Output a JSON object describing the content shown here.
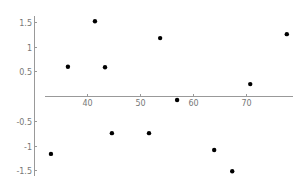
{
  "chart_data": {
    "type": "scatter",
    "title": "",
    "xlabel": "",
    "ylabel": "",
    "xlim": [
      31.5,
      79.5
    ],
    "ylim": [
      -1.6,
      1.6
    ],
    "grid": false,
    "legend": null,
    "x_ticks": [
      40,
      50,
      60,
      70
    ],
    "x_tick_labels": [
      "40",
      "50",
      "60",
      "70"
    ],
    "y_ticks": [
      1.5,
      1,
      0.5,
      -0.5,
      -1,
      -1.5
    ],
    "y_tick_labels": [
      "1.5",
      "1",
      "0.5",
      "-0.5",
      "-1",
      "-1.5"
    ],
    "points": [
      {
        "x": 33.2,
        "y": -1.17
      },
      {
        "x": 36.4,
        "y": 0.59
      },
      {
        "x": 41.5,
        "y": 1.51
      },
      {
        "x": 43.4,
        "y": 0.58
      },
      {
        "x": 44.7,
        "y": -0.75
      },
      {
        "x": 51.7,
        "y": -0.75
      },
      {
        "x": 53.8,
        "y": 1.17
      },
      {
        "x": 57.0,
        "y": -0.08
      },
      {
        "x": 64.0,
        "y": -1.09
      },
      {
        "x": 67.4,
        "y": -1.52
      },
      {
        "x": 70.8,
        "y": 0.24
      },
      {
        "x": 77.7,
        "y": 1.25
      }
    ],
    "marker_color": "#000000",
    "axis_color": "#999999"
  }
}
